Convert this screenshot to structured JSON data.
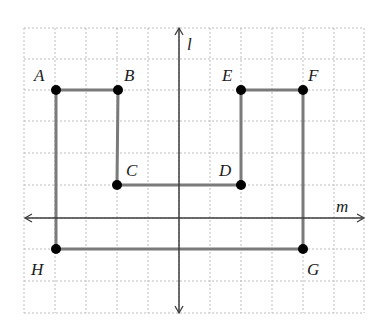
{
  "diagram": {
    "type": "coordinate-grid-figure",
    "grid": {
      "x_lines": [
        24,
        55,
        86,
        117,
        148,
        179,
        210,
        241,
        272,
        303,
        334,
        364
      ],
      "y_lines": [
        28,
        59,
        90,
        121,
        153,
        185,
        218,
        249,
        281,
        313
      ],
      "color": "#bdbdbd"
    },
    "axes": {
      "l": {
        "label": "l",
        "x": 179,
        "y1": 28,
        "y2": 313,
        "label_x": 187,
        "label_y": 50
      },
      "m": {
        "label": "m",
        "y": 218,
        "x1": 25,
        "x2": 364,
        "label_x": 336,
        "label_y": 212
      },
      "color": "#3c3c3c"
    },
    "points": [
      {
        "name": "A",
        "x": 56,
        "y": 90,
        "label_x": 34,
        "label_y": 81
      },
      {
        "name": "B",
        "x": 118,
        "y": 90,
        "label_x": 124,
        "label_y": 81
      },
      {
        "name": "C",
        "x": 117,
        "y": 185,
        "label_x": 126,
        "label_y": 176
      },
      {
        "name": "D",
        "x": 241,
        "y": 185,
        "label_x": 219,
        "label_y": 176
      },
      {
        "name": "E",
        "x": 241,
        "y": 90,
        "label_x": 222,
        "label_y": 81
      },
      {
        "name": "F",
        "x": 303,
        "y": 90,
        "label_x": 308,
        "label_y": 81
      },
      {
        "name": "G",
        "x": 303,
        "y": 249,
        "label_x": 307,
        "label_y": 275
      },
      {
        "name": "H",
        "x": 56,
        "y": 249,
        "label_x": 31,
        "label_y": 275
      }
    ],
    "polygon_order": [
      "A",
      "B",
      "C",
      "D",
      "E",
      "F",
      "G",
      "H"
    ],
    "segment_color": "#7a7a7a",
    "point_color": "#000000"
  }
}
